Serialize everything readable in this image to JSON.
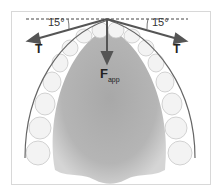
{
  "diagram": {
    "angle_left": "15°",
    "angle_right": "15°",
    "tension_left": "T",
    "tension_right": "T",
    "force_label": "F",
    "force_subscript": "app",
    "colors": {
      "arrow": "#555555",
      "palate": "#9a9a9a",
      "teeth": "#f2f2f2",
      "arch_wire": "#666666"
    }
  }
}
